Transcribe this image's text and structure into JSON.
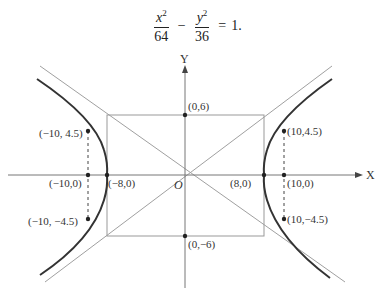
{
  "equation": {
    "term1_numerator_var": "x",
    "term1_numerator_exp": "2",
    "term1_denominator": "64",
    "operator": "−",
    "term2_numerator_var": "y",
    "term2_numerator_exp": "2",
    "term2_denominator": "36",
    "equals": "=",
    "rhs": "1."
  },
  "axes": {
    "x_label": "X",
    "y_label": "Y",
    "origin_label": "O"
  },
  "points": {
    "top": "(0,6)",
    "bottom": "(0,−6)",
    "left_vertex": "(−8,0)",
    "right_vertex": "(8,0)",
    "left_foot": "(−10,0)",
    "right_foot": "(10,0)",
    "left_upper": "(−10, 4.5)",
    "left_lower": "(−10, −4.5)",
    "right_upper": "(10,4.5)",
    "right_lower": "(10,−4.5)"
  },
  "colors": {
    "curve": "#333333",
    "guide_lines": "#9a9a9a",
    "axes": "#777777"
  }
}
